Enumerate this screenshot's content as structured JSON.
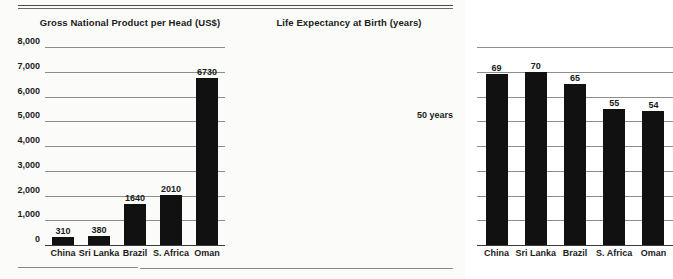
{
  "rules": {
    "top": "double-rule",
    "bottom": "single-rule"
  },
  "chart_data": [
    {
      "id": "gnp",
      "type": "bar",
      "title": "Gross National Product per Head (US$)",
      "xlabel": "",
      "ylabel": "",
      "categories": [
        "China",
        "Sri Lanka",
        "Brazil",
        "S. Africa",
        "Oman"
      ],
      "values": [
        310,
        380,
        1640,
        2010,
        6730
      ],
      "value_labels": [
        "310",
        "380",
        "1640",
        "2010",
        "6730"
      ],
      "ylim": [
        0,
        8000
      ],
      "yticks": [
        0,
        1000,
        2000,
        3000,
        4000,
        5000,
        6000,
        7000,
        8000
      ],
      "ytick_labels": [
        "0",
        "1,000",
        "2,000",
        "3,000",
        "4,000",
        "5,000",
        "6,000",
        "7,000",
        "8,000"
      ],
      "grid": true,
      "legend": "none"
    },
    {
      "id": "life-expectancy",
      "type": "bar",
      "title": "Life Expectancy at Birth (years)",
      "xlabel": "",
      "ylabel": "",
      "categories": [
        "China",
        "Sri Lanka",
        "Brazil",
        "S. Africa",
        "Oman"
      ],
      "values": [
        69,
        70,
        65,
        55,
        54
      ],
      "value_labels": [
        "69",
        "70",
        "65",
        "55",
        "54"
      ],
      "ylim": [
        0,
        80
      ],
      "yticks": [
        0,
        10,
        20,
        30,
        40,
        50,
        60,
        70,
        80
      ],
      "ytick_labels": [
        "",
        "",
        "",
        "",
        "",
        "50 years",
        "",
        "",
        ""
      ],
      "annotation": "50 years",
      "annotation_value": 50,
      "grid": true,
      "legend": "none"
    }
  ]
}
